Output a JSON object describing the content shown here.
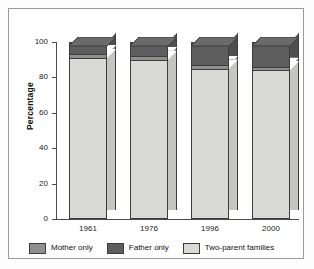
{
  "chart_data": {
    "type": "bar",
    "subtype": "stacked-column-3d",
    "title": "",
    "xlabel": "",
    "ylabel": "Percentage",
    "ylim": [
      0,
      100
    ],
    "yticks": [
      0,
      20,
      40,
      60,
      80,
      100
    ],
    "ytick_labels": [
      "0",
      "20",
      "40",
      "60",
      "80",
      "100"
    ],
    "grid": false,
    "legend_position": "bottom",
    "categories": [
      "1961",
      "1976",
      "1996",
      "2000"
    ],
    "series": [
      {
        "name": "Two-parent families",
        "color": "#d9d9d6",
        "values": [
          91,
          90,
          85,
          84
        ]
      },
      {
        "name": "Mother only",
        "color": "#8f8f8f",
        "values": [
          2,
          2,
          2,
          2
        ]
      },
      {
        "name": "Father only",
        "color": "#5e5e5e",
        "values": [
          7,
          8,
          13,
          14
        ]
      }
    ],
    "annotations": []
  },
  "legend": {
    "items": [
      {
        "label": "Mother only",
        "color": "#8f8f8f"
      },
      {
        "label": "Father only",
        "color": "#5e5e5e"
      },
      {
        "label": "Two-parent families",
        "color": "#d9d9d6"
      }
    ]
  },
  "axis": {
    "y_title": "Percentage"
  }
}
